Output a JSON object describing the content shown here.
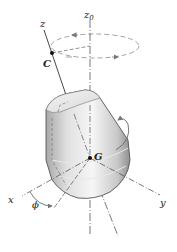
{
  "diagram": {
    "labels": {
      "z": "z",
      "z0": "z",
      "z0_sub": "0",
      "C": "C",
      "G": "G",
      "x": "x",
      "y": "y",
      "phi": "ϕ"
    },
    "colors": {
      "line": "#333333",
      "dashed": "#888888",
      "body_light": "#f2f2f2",
      "body_mid": "#cfcfcf",
      "body_dark": "#9a9a9a"
    }
  }
}
